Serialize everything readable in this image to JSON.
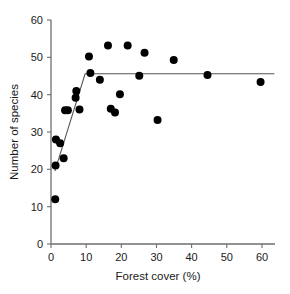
{
  "chart_data": {
    "type": "scatter",
    "title": "",
    "xlabel": "Forest cover (%)",
    "ylabel": "Number of species",
    "xlim": [
      0,
      65
    ],
    "ylim": [
      0,
      60
    ],
    "xticks": [
      0,
      10,
      20,
      30,
      40,
      50,
      60
    ],
    "yticks": [
      0,
      10,
      20,
      30,
      40,
      50,
      60
    ],
    "xtick_labels": [
      "0",
      "10",
      "20",
      "30",
      "40",
      "50",
      "60"
    ],
    "ytick_labels": [
      "0",
      "10",
      "20",
      "30",
      "40",
      "50",
      "60"
    ],
    "grid": false,
    "legend": null,
    "marker_color": "#000000",
    "marker_size": 4,
    "points": [
      {
        "x": 1.2,
        "y": 12.0
      },
      {
        "x": 1.3,
        "y": 21.0
      },
      {
        "x": 1.4,
        "y": 28.0
      },
      {
        "x": 2.6,
        "y": 27.0
      },
      {
        "x": 3.6,
        "y": 23.0
      },
      {
        "x": 4.0,
        "y": 35.8
      },
      {
        "x": 4.8,
        "y": 35.8
      },
      {
        "x": 7.0,
        "y": 39.2
      },
      {
        "x": 7.2,
        "y": 41.0
      },
      {
        "x": 8.1,
        "y": 36.0
      },
      {
        "x": 10.8,
        "y": 50.2
      },
      {
        "x": 11.2,
        "y": 45.8
      },
      {
        "x": 13.9,
        "y": 44.0
      },
      {
        "x": 16.2,
        "y": 53.2
      },
      {
        "x": 17.0,
        "y": 36.2
      },
      {
        "x": 18.2,
        "y": 35.2
      },
      {
        "x": 19.6,
        "y": 40.1
      },
      {
        "x": 21.8,
        "y": 53.2
      },
      {
        "x": 25.1,
        "y": 45.1
      },
      {
        "x": 26.6,
        "y": 51.2
      },
      {
        "x": 30.3,
        "y": 33.2
      },
      {
        "x": 34.9,
        "y": 49.3
      },
      {
        "x": 44.5,
        "y": 45.3
      },
      {
        "x": 59.6,
        "y": 43.4
      }
    ],
    "fit_line": {
      "type": "piecewise-linear",
      "description": "two-segment breakpoint regression: steep rise then plateau",
      "vertices": [
        {
          "x": 1.1,
          "y": 19.5
        },
        {
          "x": 9.7,
          "y": 45.6
        },
        {
          "x": 63.5,
          "y": 45.6
        }
      ]
    }
  }
}
